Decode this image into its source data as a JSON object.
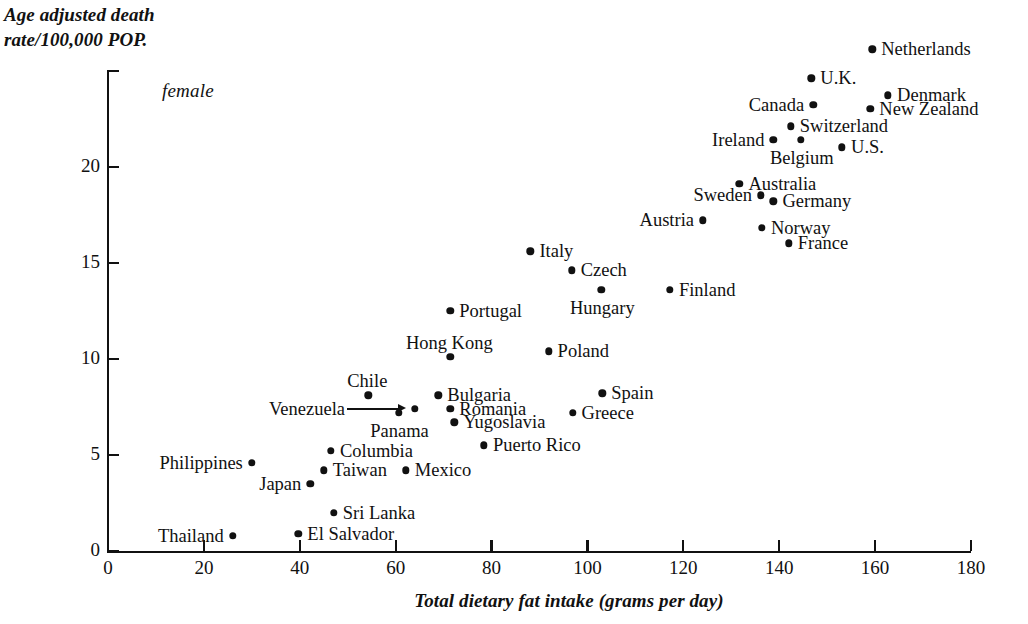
{
  "figure": {
    "ylabel_line1": "Age adjusted death",
    "ylabel_line2": "rate/100,000 POP.",
    "xlabel": "Total dietary fat intake (grams per day)",
    "series_note": "female",
    "marker_color": "#111111",
    "axis_color": "#111111",
    "background": "#ffffff"
  },
  "chart_data": {
    "type": "scatter",
    "title": "",
    "subtitle": "",
    "xlabel": "Total dietary fat intake (grams per day)",
    "ylabel": "Age adjusted death rate/100,000 POP.",
    "annotations": [
      "female"
    ],
    "grid": false,
    "legend": null,
    "xlim": [
      0,
      180
    ],
    "ylim": [
      0,
      25
    ],
    "xticks": [
      0,
      20,
      40,
      60,
      80,
      100,
      120,
      140,
      160,
      180
    ],
    "yticks": [
      0,
      5,
      10,
      15,
      20
    ],
    "xtick_labels": [
      "0",
      "20",
      "40",
      "60",
      "80",
      "100",
      "120",
      "140",
      "160",
      "180"
    ],
    "ytick_labels": [
      "0",
      "5",
      "10",
      "15",
      "20"
    ],
    "series": [
      {
        "name": "female",
        "points": [
          {
            "label": "Netherlands",
            "x": 159.4,
            "y": 26.1,
            "label_side": "right"
          },
          {
            "label": "U.K.",
            "x": 146.7,
            "y": 24.6,
            "label_side": "right"
          },
          {
            "label": "Denmark",
            "x": 162.7,
            "y": 23.7,
            "label_side": "right"
          },
          {
            "label": "Canada",
            "x": 147.1,
            "y": 23.2,
            "label_side": "left"
          },
          {
            "label": "New Zealand",
            "x": 159.0,
            "y": 23.0,
            "label_side": "right"
          },
          {
            "label": "Switzerland",
            "x": 142.4,
            "y": 22.1,
            "label_side": "right"
          },
          {
            "label": "Ireland",
            "x": 138.8,
            "y": 21.4,
            "label_side": "left"
          },
          {
            "label": "Belgium",
            "x": 144.5,
            "y": 21.4,
            "label_side": "below"
          },
          {
            "label": "U.S.",
            "x": 153.1,
            "y": 21.0,
            "label_side": "right"
          },
          {
            "label": "Australia",
            "x": 131.7,
            "y": 19.1,
            "label_side": "right"
          },
          {
            "label": "Sweden",
            "x": 136.2,
            "y": 18.5,
            "label_side": "left"
          },
          {
            "label": "Germany",
            "x": 138.8,
            "y": 18.2,
            "label_side": "right"
          },
          {
            "label": "Austria",
            "x": 124.1,
            "y": 17.2,
            "label_side": "left"
          },
          {
            "label": "Norway",
            "x": 136.4,
            "y": 16.8,
            "label_side": "right"
          },
          {
            "label": "France",
            "x": 142.0,
            "y": 16.0,
            "label_side": "right"
          },
          {
            "label": "Italy",
            "x": 88.1,
            "y": 15.6,
            "label_side": "right"
          },
          {
            "label": "Czech",
            "x": 96.7,
            "y": 14.6,
            "label_side": "right"
          },
          {
            "label": "Hungary",
            "x": 102.9,
            "y": 13.6,
            "label_side": "below"
          },
          {
            "label": "Finland",
            "x": 117.2,
            "y": 13.6,
            "label_side": "right"
          },
          {
            "label": "Portugal",
            "x": 71.4,
            "y": 12.5,
            "label_side": "right"
          },
          {
            "label": "Hong Kong",
            "x": 71.4,
            "y": 10.1,
            "label_side": "above"
          },
          {
            "label": "Poland",
            "x": 91.9,
            "y": 10.4,
            "label_side": "right"
          },
          {
            "label": "Spain",
            "x": 103.1,
            "y": 8.2,
            "label_side": "right"
          },
          {
            "label": "Chile",
            "x": 54.3,
            "y": 8.1,
            "label_side": "above"
          },
          {
            "label": "Bulgaria",
            "x": 68.9,
            "y": 8.1,
            "label_side": "right"
          },
          {
            "label": "Romania",
            "x": 71.4,
            "y": 7.4,
            "label_side": "right"
          },
          {
            "label": "Greece",
            "x": 96.9,
            "y": 7.2,
            "label_side": "right"
          },
          {
            "label": "Venezuela",
            "x": 64.0,
            "y": 7.4,
            "label_side": "leader"
          },
          {
            "label": "Yugoslavia",
            "x": 72.2,
            "y": 6.7,
            "label_side": "right"
          },
          {
            "label": "Panama",
            "x": 60.6,
            "y": 7.2,
            "label_side": "below"
          },
          {
            "label": "Puerto Rico",
            "x": 78.4,
            "y": 5.5,
            "label_side": "right"
          },
          {
            "label": "Columbia",
            "x": 46.5,
            "y": 5.2,
            "label_side": "right"
          },
          {
            "label": "Philippines",
            "x": 30.0,
            "y": 4.6,
            "label_side": "left"
          },
          {
            "label": "Taiwan",
            "x": 45.0,
            "y": 4.2,
            "label_side": "right"
          },
          {
            "label": "Mexico",
            "x": 62.1,
            "y": 4.2,
            "label_side": "right"
          },
          {
            "label": "Japan",
            "x": 42.2,
            "y": 3.5,
            "label_side": "left"
          },
          {
            "label": "Sri Lanka",
            "x": 47.1,
            "y": 2.0,
            "label_side": "right"
          },
          {
            "label": "El Salvador",
            "x": 39.7,
            "y": 0.9,
            "label_side": "right"
          },
          {
            "label": "Thailand",
            "x": 26.0,
            "y": 0.8,
            "label_side": "left"
          }
        ]
      }
    ]
  }
}
